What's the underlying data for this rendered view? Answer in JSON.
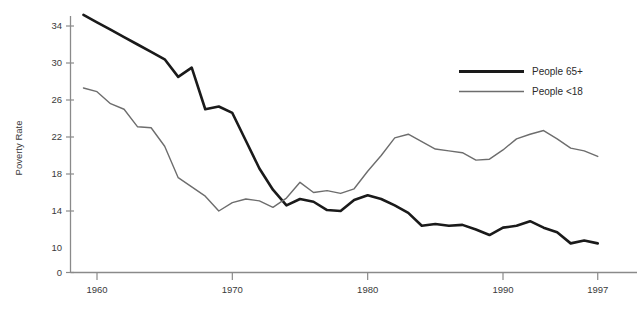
{
  "chart_data": {
    "type": "line",
    "title": "",
    "xlabel": "",
    "ylabel": "Poverty Rate",
    "xlim": [
      1959,
      1997
    ],
    "ylim": [
      10,
      35.5
    ],
    "grid": false,
    "legend_position": "top-right",
    "x_ticks": [
      "1960",
      "1970",
      "1980",
      "1990",
      "1997"
    ],
    "x_tick_values": [
      1960,
      1970,
      1980,
      1990,
      1997
    ],
    "x_last_tick_clipped": true,
    "y_ticks": [
      "34",
      "30",
      "26",
      "22",
      "18",
      "14",
      "10",
      "0"
    ],
    "y_tick_values": [
      34,
      30,
      26,
      22,
      18,
      14,
      10,
      0
    ],
    "y_axis_broken": true,
    "x": [
      1959,
      1960,
      1961,
      1962,
      1963,
      1964,
      1965,
      1966,
      1967,
      1968,
      1969,
      1970,
      1971,
      1972,
      1973,
      1974,
      1975,
      1976,
      1977,
      1978,
      1979,
      1980,
      1981,
      1982,
      1983,
      1984,
      1985,
      1986,
      1987,
      1988,
      1989,
      1990,
      1991,
      1992,
      1993,
      1994,
      1995,
      1996,
      1997
    ],
    "series": [
      {
        "name": "People 65+",
        "color": "#1a1a1a",
        "line_width": 2.6,
        "values": [
          35.2,
          34.4,
          33.6,
          32.8,
          32.0,
          31.2,
          30.4,
          28.5,
          29.5,
          25.0,
          25.3,
          24.6,
          21.6,
          18.6,
          16.3,
          14.6,
          15.3,
          15.0,
          14.1,
          14.0,
          15.2,
          15.7,
          15.3,
          14.6,
          13.8,
          12.4,
          12.6,
          12.4,
          12.5,
          12.0,
          11.4,
          12.2,
          12.4,
          12.9,
          12.2,
          11.7,
          10.5,
          10.8,
          10.5
        ]
      },
      {
        "name": "People <18",
        "color": "#6d6d6d",
        "line_width": 1.4,
        "values": [
          27.3,
          26.9,
          25.6,
          25.0,
          23.1,
          23.0,
          21.0,
          17.6,
          16.6,
          15.6,
          14.0,
          14.9,
          15.3,
          15.1,
          14.4,
          15.4,
          17.1,
          16.0,
          16.2,
          15.9,
          16.4,
          18.3,
          20.0,
          21.9,
          22.3,
          21.5,
          20.7,
          20.5,
          20.3,
          19.5,
          19.6,
          20.6,
          21.8,
          22.3,
          22.7,
          21.8,
          20.8,
          20.5,
          19.9
        ]
      }
    ],
    "annotations": []
  },
  "legend": {
    "items": [
      {
        "label": "People 65+"
      },
      {
        "label": "People <18"
      }
    ]
  },
  "axis": {
    "y_title": "Poverty Rate"
  }
}
